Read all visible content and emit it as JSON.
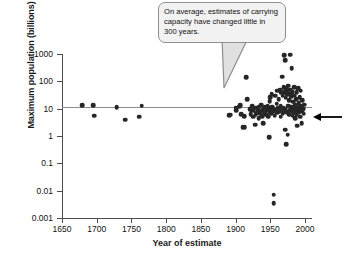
{
  "chart_data": {
    "type": "scatter",
    "title": "",
    "xlabel": "Year of estimate",
    "ylabel": "Maximum population (billions)",
    "xlim": [
      1650,
      2010
    ],
    "ylim": [
      0.001,
      1000
    ],
    "yscale": "log",
    "xticks": [
      1650,
      1700,
      1750,
      1800,
      1850,
      1900,
      1950,
      2000
    ],
    "xtick_labels": [
      "1650",
      "1700",
      "1750",
      "1800",
      "1850",
      "1900",
      "1950",
      "2000"
    ],
    "yticks": [
      1000,
      100,
      10,
      1,
      0.1,
      0.01,
      0.001
    ],
    "ytick_labels": [
      "1000",
      "100",
      "10",
      "1",
      "0.1",
      "0.01",
      "0.001"
    ],
    "grid": false,
    "legend": "none",
    "marker_color": "#262626",
    "trendline": {
      "type": "horizontal",
      "value": 12,
      "color": "#8c8c8c",
      "label": ""
    },
    "annotations": [
      {
        "name": "callout",
        "text": "On average, estimates of carrying capacity have changed little in 300 years.",
        "points_to_x": 1953,
        "points_to_y": 22
      },
      {
        "name": "right-arrow-marker",
        "text": "",
        "points_to_x": 2000,
        "points_to_y": 8
      }
    ],
    "points": [
      {
        "x": 1679,
        "y": 13.4
      },
      {
        "x": 1695,
        "y": 13.4
      },
      {
        "x": 1696,
        "y": 5.5
      },
      {
        "x": 1729,
        "y": 11.5
      },
      {
        "x": 1741,
        "y": 4.0
      },
      {
        "x": 1761,
        "y": 5.0
      },
      {
        "x": 1765,
        "y": 13.0
      },
      {
        "x": 1891,
        "y": 5.9
      },
      {
        "x": 1893,
        "y": 6.0
      },
      {
        "x": 1900,
        "y": 11.0
      },
      {
        "x": 1901,
        "y": 9.0
      },
      {
        "x": 1905,
        "y": 12.0
      },
      {
        "x": 1907,
        "y": 13.5
      },
      {
        "x": 1908,
        "y": 6.2
      },
      {
        "x": 1910,
        "y": 2.1
      },
      {
        "x": 1912,
        "y": 5.3
      },
      {
        "x": 1913,
        "y": 2.1
      },
      {
        "x": 1915,
        "y": 140.0
      },
      {
        "x": 1917,
        "y": 22.0
      },
      {
        "x": 1920,
        "y": 9.5
      },
      {
        "x": 1922,
        "y": 6.2
      },
      {
        "x": 1923,
        "y": 8.5
      },
      {
        "x": 1924,
        "y": 12.5
      },
      {
        "x": 1925,
        "y": 5.0
      },
      {
        "x": 1926,
        "y": 9.0
      },
      {
        "x": 1928,
        "y": 2.6
      },
      {
        "x": 1929,
        "y": 6.3
      },
      {
        "x": 1930,
        "y": 11.0
      },
      {
        "x": 1931,
        "y": 7.0
      },
      {
        "x": 1932,
        "y": 9.6
      },
      {
        "x": 1933,
        "y": 4.5
      },
      {
        "x": 1934,
        "y": 12.0
      },
      {
        "x": 1935,
        "y": 6.8
      },
      {
        "x": 1936,
        "y": 8.0
      },
      {
        "x": 1937,
        "y": 14.0
      },
      {
        "x": 1938,
        "y": 5.4
      },
      {
        "x": 1939,
        "y": 9.0
      },
      {
        "x": 1940,
        "y": 3.0
      },
      {
        "x": 1941,
        "y": 10.5
      },
      {
        "x": 1942,
        "y": 7.2
      },
      {
        "x": 1943,
        "y": 11.5
      },
      {
        "x": 1944,
        "y": 6.0
      },
      {
        "x": 1945,
        "y": 8.5
      },
      {
        "x": 1946,
        "y": 13.0
      },
      {
        "x": 1947,
        "y": 5.0
      },
      {
        "x": 1948,
        "y": 9.5
      },
      {
        "x": 1948,
        "y": 0.9
      },
      {
        "x": 1949,
        "y": 7.5
      },
      {
        "x": 1949,
        "y": 19.0
      },
      {
        "x": 1950,
        "y": 11.0
      },
      {
        "x": 1950,
        "y": 26.0
      },
      {
        "x": 1951,
        "y": 6.5
      },
      {
        "x": 1952,
        "y": 9.0
      },
      {
        "x": 1952,
        "y": 33.0
      },
      {
        "x": 1953,
        "y": 12.0
      },
      {
        "x": 1954,
        "y": 7.8
      },
      {
        "x": 1955,
        "y": 0.0072
      },
      {
        "x": 1955,
        "y": 0.0035
      },
      {
        "x": 1955,
        "y": 10.0
      },
      {
        "x": 1956,
        "y": 5.5
      },
      {
        "x": 1957,
        "y": 30.0
      },
      {
        "x": 1958,
        "y": 9.0
      },
      {
        "x": 1959,
        "y": 15.0
      },
      {
        "x": 1960,
        "y": 7.0
      },
      {
        "x": 1960,
        "y": 45.0
      },
      {
        "x": 1961,
        "y": 11.0
      },
      {
        "x": 1962,
        "y": 22.0
      },
      {
        "x": 1963,
        "y": 8.0
      },
      {
        "x": 1964,
        "y": 50.0
      },
      {
        "x": 1965,
        "y": 12.5
      },
      {
        "x": 1965,
        "y": 5.0
      },
      {
        "x": 1966,
        "y": 38.0
      },
      {
        "x": 1967,
        "y": 9.5
      },
      {
        "x": 1967,
        "y": 150.0
      },
      {
        "x": 1968,
        "y": 30.0
      },
      {
        "x": 1968,
        "y": 6.5
      },
      {
        "x": 1969,
        "y": 60.0
      },
      {
        "x": 1969,
        "y": 11.0
      },
      {
        "x": 1970,
        "y": 900.0
      },
      {
        "x": 1970,
        "y": 40.0
      },
      {
        "x": 1970,
        "y": 8.0
      },
      {
        "x": 1971,
        "y": 600.0
      },
      {
        "x": 1971,
        "y": 1.7
      },
      {
        "x": 1972,
        "y": 25.0
      },
      {
        "x": 1972,
        "y": 10.0
      },
      {
        "x": 1973,
        "y": 55.0
      },
      {
        "x": 1973,
        "y": 0.5
      },
      {
        "x": 1974,
        "y": 33.0
      },
      {
        "x": 1974,
        "y": 7.5
      },
      {
        "x": 1975,
        "y": 1.1
      },
      {
        "x": 1975,
        "y": 44.0
      },
      {
        "x": 1976,
        "y": 13.0
      },
      {
        "x": 1976,
        "y": 70.0
      },
      {
        "x": 1977,
        "y": 20.0
      },
      {
        "x": 1977,
        "y": 6.0
      },
      {
        "x": 1978,
        "y": 35.0
      },
      {
        "x": 1978,
        "y": 9.0
      },
      {
        "x": 1979,
        "y": 950.0
      },
      {
        "x": 1979,
        "y": 50.0
      },
      {
        "x": 1980,
        "y": 12.0
      },
      {
        "x": 1980,
        "y": 28.0
      },
      {
        "x": 1981,
        "y": 300.0
      },
      {
        "x": 1981,
        "y": 8.0
      },
      {
        "x": 1982,
        "y": 40.0
      },
      {
        "x": 1982,
        "y": 5.5
      },
      {
        "x": 1983,
        "y": 18.0
      },
      {
        "x": 1983,
        "y": 11.0
      },
      {
        "x": 1984,
        "y": 60.0
      },
      {
        "x": 1984,
        "y": 7.0
      },
      {
        "x": 1985,
        "y": 30.0
      },
      {
        "x": 1985,
        "y": 9.5
      },
      {
        "x": 1986,
        "y": 14.0
      },
      {
        "x": 1986,
        "y": 4.5
      },
      {
        "x": 1987,
        "y": 22.0
      },
      {
        "x": 1987,
        "y": 8.5
      },
      {
        "x": 1988,
        "y": 40.0
      },
      {
        "x": 1988,
        "y": 6.0
      },
      {
        "x": 1989,
        "y": 11.0
      },
      {
        "x": 1989,
        "y": 2.4
      },
      {
        "x": 1990,
        "y": 55.0
      },
      {
        "x": 1990,
        "y": 9.0
      },
      {
        "x": 1991,
        "y": 16.0
      },
      {
        "x": 1991,
        "y": 7.0
      },
      {
        "x": 1992,
        "y": 26.0
      },
      {
        "x": 1992,
        "y": 10.5
      },
      {
        "x": 1993,
        "y": 13.0
      },
      {
        "x": 1993,
        "y": 5.0
      },
      {
        "x": 1994,
        "y": 45.0
      },
      {
        "x": 1994,
        "y": 8.0
      },
      {
        "x": 1995,
        "y": 12.0
      },
      {
        "x": 1995,
        "y": 3.0
      },
      {
        "x": 1996,
        "y": 20.0
      },
      {
        "x": 1996,
        "y": 9.0
      },
      {
        "x": 1997,
        "y": 10.0
      },
      {
        "x": 1998,
        "y": 6.5
      },
      {
        "x": 1999,
        "y": 14.0
      }
    ]
  }
}
